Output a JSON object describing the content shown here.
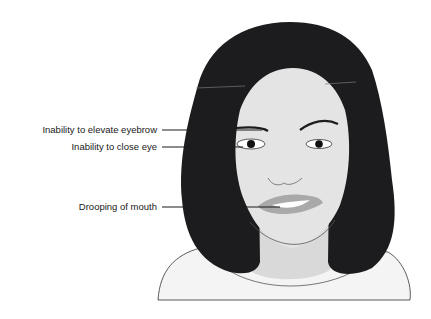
{
  "diagram": {
    "labels": [
      {
        "id": "eyebrow",
        "text": "Inability to elevate eyebrow"
      },
      {
        "id": "eye",
        "text": "Inability to close eye"
      },
      {
        "id": "mouth",
        "text": "Drooping of mouth"
      }
    ],
    "colors": {
      "hair": "#1c1c1e",
      "skin": "#e4e4e4",
      "skin_shadow": "#cfcfcf",
      "lips": "#a9a9a9",
      "leader_line": "#1a1a1a",
      "background": "#ffffff"
    }
  }
}
